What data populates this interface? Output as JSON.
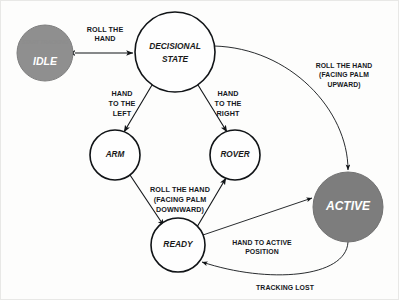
{
  "diagram": {
    "background_color": "#fdfdfc",
    "nodes": [
      {
        "id": "idle",
        "label": "IDLE",
        "sublabel": "START TRACKING",
        "style": "filled-gray",
        "fill": "#8f8f8f",
        "text_color": "#ffffff",
        "cx": 45,
        "cy": 53,
        "r": 28
      },
      {
        "id": "decisional-state",
        "label": "DECISIONAL",
        "label_line2": "STATE",
        "style": "outline",
        "fill": "#fefefe",
        "text_color": "#1a1a1a",
        "cx": 175,
        "cy": 52,
        "r": 40
      },
      {
        "id": "arm",
        "label": "ARM",
        "style": "outline",
        "fill": "#fefefe",
        "text_color": "#1a1a1a",
        "cx": 115,
        "cy": 155,
        "r": 25
      },
      {
        "id": "rover",
        "label": "ROVER",
        "style": "outline",
        "fill": "#fefefe",
        "text_color": "#1a1a1a",
        "cx": 235,
        "cy": 155,
        "r": 25
      },
      {
        "id": "ready",
        "label": "READY",
        "style": "outline",
        "fill": "#fefefe",
        "text_color": "#1a1a1a",
        "cx": 178,
        "cy": 245,
        "r": 27
      },
      {
        "id": "active",
        "label": "ACTIVE",
        "style": "filled-gray",
        "fill": "#7d7d7d",
        "text_color": "#ffffff",
        "cx": 348,
        "cy": 207,
        "r": 35
      }
    ],
    "edges": [
      {
        "id": "idle-decisional",
        "from": "idle",
        "to": "decisional-state",
        "direction": "bidirectional",
        "label": "ROLL THE",
        "label_line2": "HAND",
        "label_x": 105,
        "label_y": 36
      },
      {
        "id": "decisional-arm",
        "from": "decisional-state",
        "to": "arm",
        "direction": "bidirectional",
        "label": "HAND",
        "label_line2": "TO THE",
        "label_line3": "LEFT",
        "label_x": 126,
        "label_y": 104
      },
      {
        "id": "decisional-rover",
        "from": "decisional-state",
        "to": "rover",
        "direction": "bidirectional",
        "label": "HAND",
        "label_line2": "TO THE",
        "label_line3": "RIGHT",
        "label_x": 226,
        "label_y": 104
      },
      {
        "id": "arm-ready",
        "from": "arm",
        "to": "ready",
        "direction": "bidirectional",
        "label": "ROLL THE HAND",
        "label_line2": "(FACING PALM",
        "label_line3": "DOWNWARD)",
        "label_x": 178,
        "label_y": 198
      },
      {
        "id": "decisional-active",
        "from": "decisional-state",
        "to": "active",
        "direction": "unidirectional",
        "label": "ROLL THE HAND",
        "label_line2": "(FACING PALM",
        "label_line3": "UPWARD)",
        "label_x": 338,
        "label_y": 74
      },
      {
        "id": "ready-active",
        "from": "ready",
        "to": "active",
        "direction": "unidirectional",
        "label": "HAND TO ACTIVE",
        "label_line2": "POSITION",
        "label_x": 262,
        "label_y": 246
      },
      {
        "id": "active-ready",
        "from": "active",
        "to": "ready",
        "direction": "unidirectional",
        "label": "TRACKING LOST",
        "label_x": 280,
        "label_y": 288
      },
      {
        "id": "ready-rover",
        "from": "ready",
        "to": "rover",
        "direction": "bidirectional",
        "label": "",
        "label_x": 0,
        "label_y": 0
      }
    ]
  }
}
